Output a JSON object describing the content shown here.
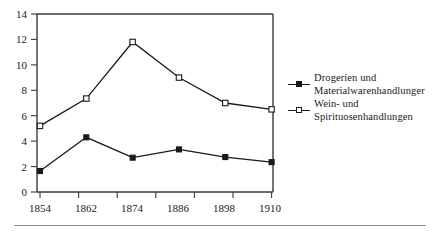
{
  "chart_data": {
    "type": "line",
    "title": "",
    "xlabel": "",
    "ylabel": "",
    "categories": [
      "1854",
      "1862",
      "1874",
      "1886",
      "1898",
      "1910"
    ],
    "x": [
      1854,
      1862,
      1874,
      1886,
      1898,
      1910
    ],
    "ylim": [
      0,
      14
    ],
    "yticks": [
      0,
      2,
      4,
      6,
      8,
      10,
      12,
      14
    ],
    "ytick_labels": [
      "0",
      "2",
      "4",
      "6",
      "8",
      "10",
      "12",
      "14"
    ],
    "grid": false,
    "legend_position": "right",
    "series": [
      {
        "name": "Drogerien und Materialwarenhandlunger",
        "name_lines": [
          "Drogerien und",
          "Materialwarenhandlunger"
        ],
        "marker": "filled-square",
        "color": "#1a1a1a",
        "values": [
          1.65,
          4.3,
          2.7,
          3.35,
          2.75,
          2.35
        ]
      },
      {
        "name": "Wein- und Spirituosenhandlungen",
        "name_lines": [
          "Wein- und",
          "Spirituosenhandlungen"
        ],
        "marker": "open-square",
        "color": "#1a1a1a",
        "values": [
          5.2,
          7.35,
          11.8,
          9.0,
          7.0,
          6.5
        ]
      }
    ]
  },
  "legend": {
    "entries": [
      {
        "key": "filled-square",
        "line1": "Drogerien und",
        "line2": "Materialwarenhandlunger"
      },
      {
        "key": "open-square",
        "line1": "Wein- und",
        "line2": "Spirituosenhandlungen"
      }
    ]
  },
  "axes": {
    "y_tick_labels": [
      "14",
      "12",
      "10",
      "8",
      "6",
      "4",
      "2",
      "0"
    ],
    "x_tick_labels": [
      "1854",
      "1862",
      "1874",
      "1886",
      "1898",
      "1910"
    ]
  },
  "colors": {
    "ink": "#1a1a1a",
    "axis": "#3a3a3a",
    "rule": "#8c8c8c",
    "background": "#ffffff"
  }
}
